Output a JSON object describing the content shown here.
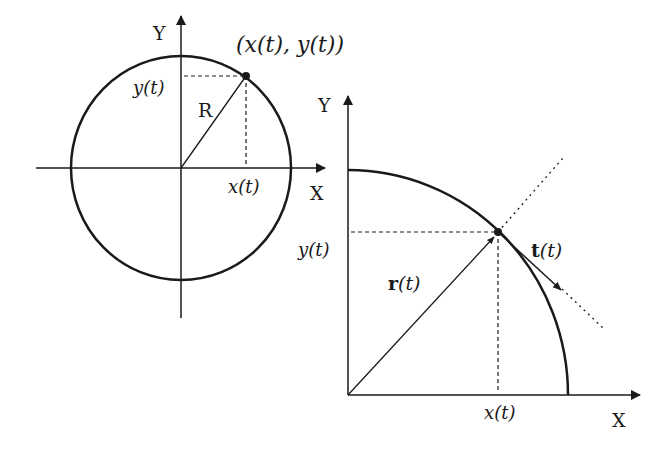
{
  "left_diagram": {
    "axis_x_label": "X",
    "axis_y_label": "Y",
    "radius_label": "R",
    "x_proj_label": "x(t)",
    "y_proj_label": "y(t)",
    "point_label": "(x(t), y(t))",
    "shape": "full circle"
  },
  "right_diagram": {
    "axis_x_label": "X",
    "axis_y_label": "Y",
    "x_proj_label": "x(t)",
    "y_proj_label": "y(t)",
    "position_vector_label": "r(t)",
    "position_vector_bold": "r",
    "position_vector_arg": "(t)",
    "tangent_vector_label": "t(t)",
    "tangent_vector_bold": "t",
    "tangent_vector_arg": "(t)",
    "shape": "quarter circle arc with tangent line"
  },
  "colors": {
    "stroke": "#1a1a1a",
    "background": "#ffffff"
  }
}
